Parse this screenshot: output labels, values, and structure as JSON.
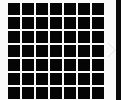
{
  "grid": {
    "rows": 7,
    "cols": 7,
    "cell_color": "#050505",
    "gap_color": "#fafafa"
  },
  "side_panel": {
    "color": "#0a0a0a"
  },
  "icons": {
    "next": "chevron-right-icon"
  }
}
